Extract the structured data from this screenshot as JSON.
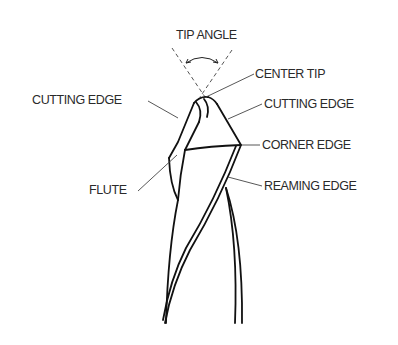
{
  "diagram": {
    "colors": {
      "line": "#111111",
      "leader": "#444444",
      "text": "#2a2a2a",
      "background": "#ffffff"
    },
    "labels": {
      "tip_angle": "TIP ANGLE",
      "center_tip": "CENTER TIP",
      "cutting_edge_left": "CUTTING EDGE",
      "cutting_edge_right": "CUTTING EDGE",
      "corner_edge": "CORNER EDGE",
      "flute": "FLUTE",
      "reaming_edge": "REAMING EDGE"
    }
  }
}
